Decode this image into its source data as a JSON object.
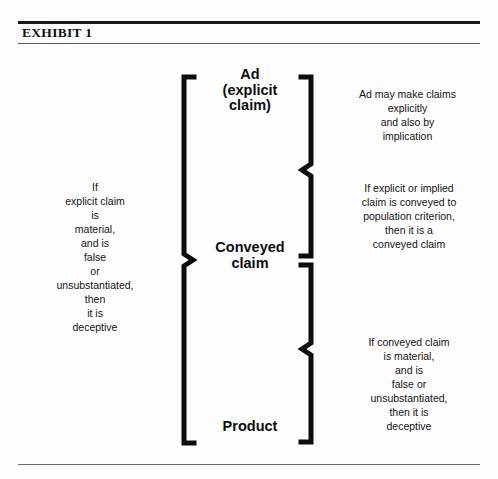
{
  "document": {
    "title": "EXHIBIT 1"
  },
  "diagram": {
    "center_labels": {
      "ad": [
        "Ad",
        "(explicit",
        "claim)"
      ],
      "conveyed": [
        "Conveyed",
        "claim"
      ],
      "product": [
        "Product"
      ]
    },
    "left_annotation": [
      "If",
      "explicit claim",
      "is",
      "material,",
      "and is",
      "false",
      "or",
      "unsubstantiated,",
      "then",
      "it is",
      "deceptive"
    ],
    "right_annotations": {
      "top": [
        "Ad may make claims",
        "explicitly",
        "and also by",
        "implication"
      ],
      "middle": [
        "If explicit or implied",
        "claim is conveyed to",
        "population criterion,",
        "then it is a",
        "conveyed claim"
      ],
      "bottom": [
        "If conveyed claim",
        "is material,",
        "and is",
        "false or",
        "unsubstantiated,",
        "then it is",
        "deceptive"
      ]
    },
    "colors": {
      "ink": "#111111",
      "background": "#fdfdfd",
      "rule": "#1a1a1a"
    }
  }
}
